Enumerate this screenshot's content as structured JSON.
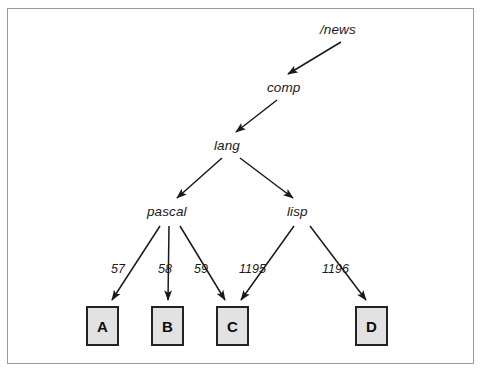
{
  "diagram": {
    "type": "tree",
    "title": "",
    "frame": {
      "border_color": "#9a9a9a"
    },
    "nodes": [
      {
        "id": "news",
        "label": "/news",
        "x": 320,
        "y": 22,
        "kind": "text"
      },
      {
        "id": "comp",
        "label": "comp",
        "x": 267,
        "y": 80,
        "kind": "text"
      },
      {
        "id": "lang",
        "label": "lang",
        "x": 214,
        "y": 138,
        "kind": "text"
      },
      {
        "id": "pascal",
        "label": "pascal",
        "x": 147,
        "y": 204,
        "kind": "text"
      },
      {
        "id": "lisp",
        "label": "lisp",
        "x": 287,
        "y": 204,
        "kind": "text"
      },
      {
        "id": "A",
        "label": "A",
        "x": 86,
        "y": 306,
        "kind": "box"
      },
      {
        "id": "B",
        "label": "B",
        "x": 151,
        "y": 306,
        "kind": "box"
      },
      {
        "id": "C",
        "label": "C",
        "x": 216,
        "y": 306,
        "kind": "box"
      },
      {
        "id": "D",
        "label": "D",
        "x": 355,
        "y": 306,
        "kind": "box"
      }
    ],
    "edges": [
      {
        "from": "news",
        "to": "comp",
        "label": "",
        "x1": 341,
        "y1": 42,
        "x2": 288,
        "y2": 74
      },
      {
        "from": "comp",
        "to": "lang",
        "label": "",
        "x1": 277,
        "y1": 100,
        "x2": 236,
        "y2": 132
      },
      {
        "from": "lang",
        "to": "pascal",
        "label": "",
        "x1": 222,
        "y1": 158,
        "x2": 177,
        "y2": 198
      },
      {
        "from": "lang",
        "to": "lisp",
        "label": "",
        "x1": 240,
        "y1": 158,
        "x2": 293,
        "y2": 198
      },
      {
        "from": "pascal",
        "to": "A",
        "label": "57",
        "x1": 160,
        "y1": 226,
        "x2": 112,
        "y2": 300,
        "lx": 111,
        "ly": 262
      },
      {
        "from": "pascal",
        "to": "B",
        "label": "58",
        "x1": 169,
        "y1": 226,
        "x2": 168,
        "y2": 300,
        "lx": 158,
        "ly": 262
      },
      {
        "from": "pascal",
        "to": "C",
        "label": "59",
        "x1": 180,
        "y1": 226,
        "x2": 225,
        "y2": 300,
        "lx": 194,
        "ly": 262
      },
      {
        "from": "lisp",
        "to": "C",
        "label": "1195",
        "x1": 294,
        "y1": 226,
        "x2": 241,
        "y2": 300,
        "lx": 239,
        "ly": 262
      },
      {
        "from": "lisp",
        "to": "D",
        "label": "1196",
        "x1": 310,
        "y1": 226,
        "x2": 366,
        "y2": 300,
        "lx": 322,
        "ly": 262
      }
    ],
    "edge_labels": [
      "57",
      "58",
      "59",
      "1195",
      "1196"
    ],
    "box_style": {
      "fill": "#e2e2e2",
      "stroke": "#232323"
    },
    "line_color": "#1a1a1a"
  }
}
